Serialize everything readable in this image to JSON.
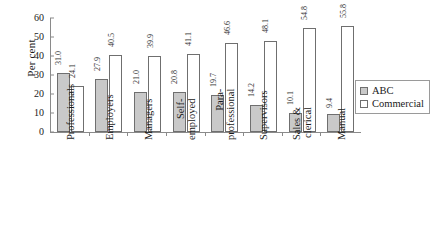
{
  "chart_data": {
    "type": "bar",
    "title": "",
    "xlabel": "",
    "ylabel": "Per cent",
    "ylim": [
      0,
      60
    ],
    "yticks": [
      0,
      10,
      20,
      30,
      40,
      50,
      60
    ],
    "grid": false,
    "legend_position": "right",
    "categories": [
      "Professionals",
      "Employers",
      "Managers",
      "Self-employed",
      "Para-professional",
      "Supervisors",
      "Sales & clerical",
      "Manual"
    ],
    "category_lines": [
      [
        "Professionals",
        ""
      ],
      [
        "Employers",
        ""
      ],
      [
        "Managers",
        ""
      ],
      [
        "Self-",
        "employed"
      ],
      [
        "Para-",
        "professional"
      ],
      [
        "Supervisors",
        ""
      ],
      [
        "Sales &",
        "clerical"
      ],
      [
        "Manual",
        ""
      ]
    ],
    "series": [
      {
        "name": "ABC",
        "color": "#c9c9c9",
        "values": [
          31.0,
          27.9,
          21.0,
          20.8,
          19.7,
          14.2,
          10.1,
          9.4
        ],
        "labels": [
          "31.0",
          "27.9",
          "21.0",
          "20.8",
          "19.7",
          "14.2",
          "10.1",
          "9.4"
        ]
      },
      {
        "name": "Commercial",
        "color": "#ffffff",
        "values": [
          24.1,
          40.5,
          39.9,
          41.1,
          46.6,
          48.1,
          54.8,
          55.8
        ],
        "labels": [
          "24.1",
          "40.5",
          "39.9",
          "41.1",
          "46.6",
          "48.1",
          "54.8",
          "55.8"
        ]
      }
    ]
  },
  "legend": {
    "items": [
      {
        "label": "ABC"
      },
      {
        "label": "Commercial"
      }
    ]
  },
  "axis": {
    "y_title": "Per cent",
    "y_tick_labels": [
      "0",
      "10",
      "20",
      "30",
      "40",
      "50",
      "60"
    ]
  }
}
